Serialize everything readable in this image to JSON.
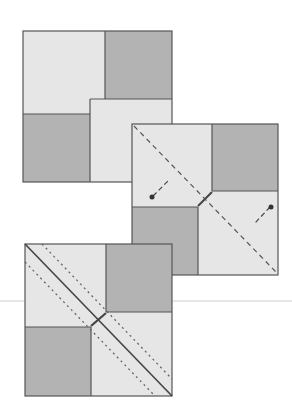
{
  "diagram": {
    "title": "",
    "colors": {
      "light": "#e6e6e6",
      "dark": "#b3b3b3",
      "stroke": "#555555",
      "fold_line": "#555555",
      "pin": "#333333",
      "guide_line": "#cfcfcf"
    },
    "steps": [
      {
        "id": "step-1",
        "description": "four-patch square"
      },
      {
        "id": "step-2",
        "description": "square with dashed diagonal fold and pins"
      },
      {
        "id": "step-3",
        "description": "square with solid diagonal seam and dotted stitching lines"
      }
    ]
  }
}
